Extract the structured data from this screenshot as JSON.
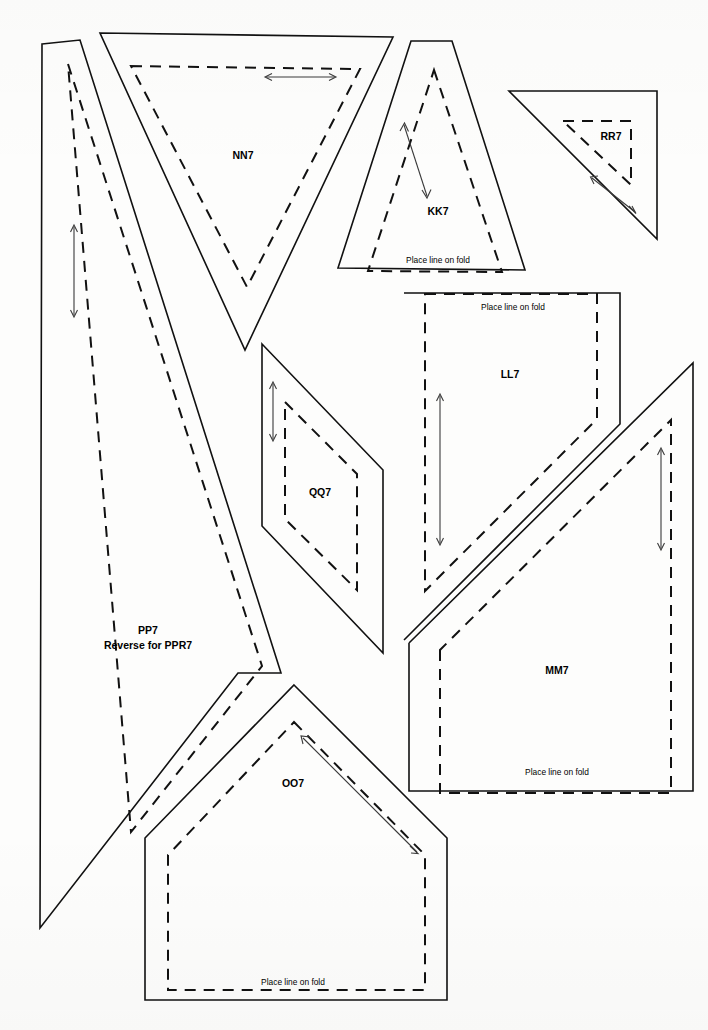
{
  "sheet": {
    "kind": "sewing-pattern-sheet",
    "width": 708,
    "height": 1030,
    "background_color": "#fdfdfc",
    "line_color": "#111111",
    "grainline_color": "#3a3a3a"
  },
  "labels": {
    "fold_instruction": "Place line on fold"
  },
  "pieces": [
    {
      "id": "NN7",
      "label": "NN7",
      "label_x": 243,
      "label_y": 156,
      "shape": "inverted-triangle",
      "has_fold_label": false,
      "grainline": "horizontal-double-arrow",
      "cut_path": "M 100,33 L 393,37 L 245,350 Z",
      "seam_path": "M 131,66 L 360,69 L 247,287 Z"
    },
    {
      "id": "KK7",
      "label": "KK7",
      "label_x": 438,
      "label_y": 212,
      "shape": "tall-triangle",
      "has_fold_label": true,
      "fold_label": "Place line on fold",
      "fold_label_x": 438,
      "fold_label_y": 261,
      "grainline": "diagonal-double-arrow",
      "cut_path": "M 411,41 L 452,41 L 525,270 L 338,268 Z",
      "seam_path": "M 434,70 L 502,272 L 368,271 Z"
    },
    {
      "id": "RR7",
      "label": "RR7",
      "label_x": 611,
      "label_y": 137,
      "shape": "right-triangle",
      "has_fold_label": false,
      "grainline": "diagonal-double-arrow",
      "cut_path": "M 509,91 L 657,91 L 657,239 Z",
      "seam_path": "M 563,121 L 631,121 L 631,185 Z"
    },
    {
      "id": "LL7",
      "label": "LL7",
      "label_x": 510,
      "label_y": 375,
      "shape": "pentagon-panel",
      "has_fold_label": true,
      "fold_label": "Place line on fold",
      "fold_label_x": 513,
      "fold_label_y": 308,
      "grainline": "vertical-double-arrow",
      "cut_path": "M 404,293 L 620,293 L 620,424 L 404,640",
      "seam_path": "M 425,294 L 597,294 L 597,419 L 425,591 Z"
    },
    {
      "id": "MM7",
      "label": "MM7",
      "label_x": 557,
      "label_y": 671,
      "shape": "pentagon-panel",
      "has_fold_label": true,
      "fold_label": "Place line on fold",
      "fold_label_x": 557,
      "fold_label_y": 773,
      "grainline": "vertical-double-arrow",
      "cut_path": "M 409,643 L 409,791 L 693,791 L 693,363 L 409,643",
      "seam_path": "M 440,650 L 440,793 L 671,793 L 671,420 Z"
    },
    {
      "id": "QQ7",
      "label": "QQ7",
      "label_x": 320,
      "label_y": 493,
      "shape": "parallelogram",
      "has_fold_label": false,
      "grainline": "vertical-double-arrow",
      "cut_path": "M 262,344 L 383,470 L 383,653 L 262,526 Z",
      "seam_path": "M 285,402 L 357,474 L 357,590 L 285,519 Z"
    },
    {
      "id": "OO7",
      "label": "OO7",
      "label_x": 293,
      "label_y": 784,
      "shape": "house-pentagon",
      "has_fold_label": true,
      "fold_label": "Place line on fold",
      "fold_label_x": 293,
      "fold_label_y": 983,
      "grainline": "diagonal-double-arrow",
      "cut_path": "M 294,685 L 447,838 L 447,1000 L 145,1000 L 145,838 Z",
      "seam_path": "M 294,722 L 425,855 L 425,990 L 168,990 L 168,855 Z"
    },
    {
      "id": "PP7",
      "label": "PP7",
      "label_sub": "Reverse for PPR7",
      "label_x": 148,
      "label_y": 631,
      "label_sub_x": 148,
      "label_sub_y": 645,
      "shape": "long-curved-blade",
      "has_fold_label": false,
      "grainline": "vertical-double-arrow",
      "cut_path": "M 42,44 L 80,40 L 281,673 L 238,673 L 40,928 Z",
      "seam_path": "M 68,64 L 262,666 L 131,832 Z"
    }
  ],
  "grainlines": [
    {
      "piece": "NN7",
      "x1": 266,
      "y1": 77,
      "x2": 335,
      "y2": 77,
      "type": "double-arrow-horizontal"
    },
    {
      "piece": "KK7",
      "x1": 404,
      "y1": 125,
      "x2": 427,
      "y2": 195,
      "type": "double-arrow-diagonal"
    },
    {
      "piece": "RR7",
      "x1": 592,
      "y1": 178,
      "x2": 634,
      "y2": 211,
      "type": "double-arrow-diagonal"
    },
    {
      "piece": "LL7",
      "x1": 440,
      "y1": 396,
      "x2": 440,
      "y2": 543,
      "type": "double-arrow-vertical"
    },
    {
      "piece": "MM7",
      "x1": 661,
      "y1": 450,
      "x2": 661,
      "y2": 548,
      "type": "double-arrow-vertical"
    },
    {
      "piece": "QQ7",
      "x1": 273,
      "y1": 384,
      "x2": 273,
      "y2": 439,
      "type": "double-arrow-vertical"
    },
    {
      "piece": "OO7",
      "x1": 303,
      "y1": 738,
      "x2": 416,
      "y2": 851,
      "type": "double-arrow-diagonal"
    },
    {
      "piece": "PP7",
      "x1": 74,
      "y1": 227,
      "x2": 74,
      "y2": 315,
      "type": "double-arrow-vertical"
    }
  ]
}
